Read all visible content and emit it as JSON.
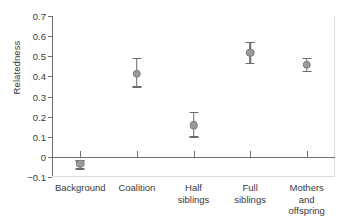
{
  "chart_data": {
    "type": "scatter",
    "title": "",
    "xlabel": "",
    "ylabel": "Relatedness",
    "ylim": [
      -0.1,
      0.7
    ],
    "yticks": [
      -0.1,
      0,
      0.1,
      0.2,
      0.3,
      0.4,
      0.5,
      0.6,
      0.7
    ],
    "ytick_labels": [
      "−0.1",
      "0",
      "0.1",
      "0.2",
      "0.3",
      "0.4",
      "0.5",
      "0.6",
      "0.7"
    ],
    "grid": false,
    "legend": "none",
    "zero_reference_line": 0,
    "categories": [
      "Background",
      "Coalition",
      "Half siblings",
      "Full siblings",
      "Mothers and offspring"
    ],
    "category_labels": [
      "Background",
      "Coalition",
      "Half\nsiblings",
      "Full\nsiblings",
      "Mothers and\noffspring"
    ],
    "values": [
      -0.035,
      0.413,
      0.158,
      0.517,
      0.458
    ],
    "error_low": [
      -0.055,
      0.352,
      0.102,
      0.467,
      0.428
    ],
    "error_high": [
      -0.018,
      0.493,
      0.225,
      0.572,
      0.492
    ],
    "points": [
      {
        "category": "Background",
        "value": -0.035,
        "low": -0.055,
        "high": -0.018
      },
      {
        "category": "Coalition",
        "value": 0.413,
        "low": 0.352,
        "high": 0.493
      },
      {
        "category": "Half siblings",
        "value": 0.158,
        "low": 0.102,
        "high": 0.225
      },
      {
        "category": "Full siblings",
        "value": 0.517,
        "low": 0.467,
        "high": 0.572
      },
      {
        "category": "Mothers and offspring",
        "value": 0.458,
        "low": 0.428,
        "high": 0.492
      }
    ],
    "colors": {
      "marker_fill": "#9a9a9a",
      "marker_edge": "#7d7d7d",
      "error_bar": "#6b6b6b",
      "axis": "#6e6e6e",
      "text": "#3a3a3a",
      "background": "#ffffff"
    }
  }
}
